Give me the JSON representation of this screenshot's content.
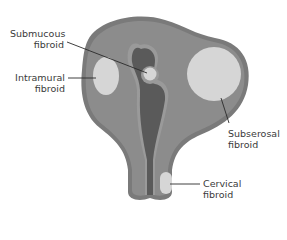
{
  "diagram": {
    "type": "uterine fibroid locations",
    "colors": {
      "uterus_outer": "#7a7a7a",
      "uterus_wall": "#8c8c8c",
      "cavity": "#5a5a5a",
      "cavity_rim": "#9a9a9a",
      "fibroid": "#d6d6d6",
      "leader_line": "#2a2a2a",
      "label_text": "#3a3a3a"
    },
    "labels": {
      "submucous": {
        "line1": "Submucous",
        "line2": "fibroid"
      },
      "intramural": {
        "line1": "Intramural",
        "line2": "fibroid"
      },
      "subserosal": {
        "line1": "Subserosal",
        "line2": "fibroid"
      },
      "cervical": {
        "line1": "Cervical",
        "line2": "fibroid"
      }
    }
  }
}
